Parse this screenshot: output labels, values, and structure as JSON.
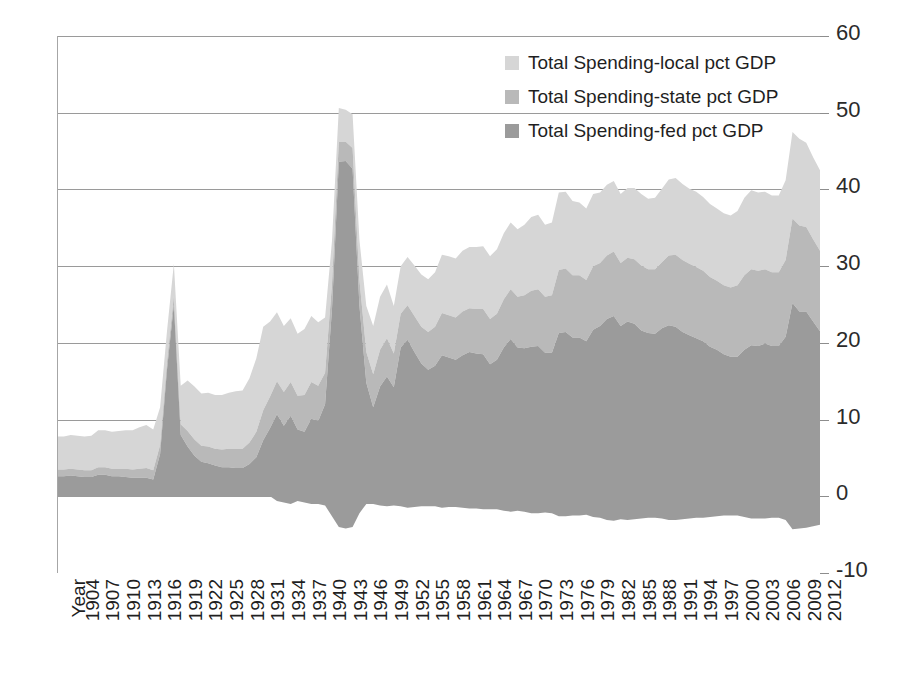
{
  "chart_data": {
    "type": "area",
    "stacked": true,
    "title": "",
    "xlabel": "Year",
    "ylabel": "",
    "ylim": [
      -10,
      60
    ],
    "yticks": [
      -10,
      0,
      10,
      20,
      30,
      40,
      50,
      60
    ],
    "ytick_labels": [
      "-10",
      "0",
      "10",
      "20",
      "30",
      "40",
      "50",
      "60"
    ],
    "grid": true,
    "legend_position": "top-right",
    "axis_label_first": "Year",
    "xtick_labels": [
      "1904",
      "1907",
      "1910",
      "1913",
      "1916",
      "1919",
      "1922",
      "1925",
      "1928",
      "1931",
      "1934",
      "1937",
      "1940",
      "1943",
      "1946",
      "1949",
      "1952",
      "1955",
      "1958",
      "1961",
      "1964",
      "1967",
      "1970",
      "1973",
      "1976",
      "1979",
      "1982",
      "1985",
      "1988",
      "1991",
      "1994",
      "1997",
      "2000",
      "2003",
      "2006",
      "2009",
      "2012"
    ],
    "xtick_step": 3,
    "x_start": 1902,
    "x_end": 2013,
    "colors": {
      "local": "#d6d6d6",
      "state": "#b9b9b9",
      "fed": "#9b9b9b",
      "gridline": "#9a9a9a",
      "axis": "#a6a6a6",
      "text": "#1f1f1f"
    },
    "x": [
      1902,
      1903,
      1904,
      1905,
      1906,
      1907,
      1908,
      1909,
      1910,
      1911,
      1912,
      1913,
      1914,
      1915,
      1916,
      1917,
      1918,
      1919,
      1920,
      1921,
      1922,
      1923,
      1924,
      1925,
      1926,
      1927,
      1928,
      1929,
      1930,
      1931,
      1932,
      1933,
      1934,
      1935,
      1936,
      1937,
      1938,
      1939,
      1940,
      1941,
      1942,
      1943,
      1944,
      1945,
      1946,
      1947,
      1948,
      1949,
      1950,
      1951,
      1952,
      1953,
      1954,
      1955,
      1956,
      1957,
      1958,
      1959,
      1960,
      1961,
      1962,
      1963,
      1964,
      1965,
      1966,
      1967,
      1968,
      1969,
      1970,
      1971,
      1972,
      1973,
      1974,
      1975,
      1976,
      1977,
      1978,
      1979,
      1980,
      1981,
      1982,
      1983,
      1984,
      1985,
      1986,
      1987,
      1988,
      1989,
      1990,
      1991,
      1992,
      1993,
      1994,
      1995,
      1996,
      1997,
      1998,
      1999,
      2000,
      2001,
      2002,
      2003,
      2004,
      2005,
      2006,
      2007,
      2008,
      2009,
      2010,
      2011,
      2012,
      2013
    ],
    "series": [
      {
        "name": "Total Spending-fed pct GDP",
        "key": "fed",
        "color": "#9b9b9b",
        "values": [
          2.6,
          2.6,
          2.7,
          2.6,
          2.5,
          2.5,
          2.8,
          2.8,
          2.6,
          2.6,
          2.5,
          2.4,
          2.4,
          2.4,
          2.2,
          5.5,
          16.5,
          25.0,
          8.0,
          6.5,
          5.3,
          4.5,
          4.3,
          4.0,
          3.8,
          3.8,
          3.7,
          3.7,
          4.2,
          5.1,
          7.3,
          8.9,
          10.7,
          9.2,
          10.5,
          8.7,
          8.4,
          10.1,
          9.8,
          12.0,
          24.3,
          43.6,
          43.7,
          42.7,
          24.8,
          14.8,
          11.6,
          14.3,
          15.6,
          14.2,
          19.4,
          20.4,
          18.8,
          17.3,
          16.5,
          17.0,
          18.4,
          18.1,
          17.8,
          18.4,
          18.8,
          18.6,
          18.5,
          17.2,
          17.8,
          19.4,
          20.5,
          19.4,
          19.3,
          19.5,
          19.6,
          18.7,
          18.7,
          21.3,
          21.4,
          20.7,
          20.7,
          20.2,
          21.7,
          22.2,
          23.1,
          23.5,
          22.2,
          22.8,
          22.5,
          21.6,
          21.3,
          21.2,
          21.9,
          22.3,
          22.1,
          21.4,
          21.0,
          20.6,
          20.2,
          19.5,
          19.1,
          18.5,
          18.2,
          18.2,
          19.1,
          19.7,
          19.6,
          19.9,
          19.6,
          19.6,
          20.8,
          25.2,
          24.1,
          24.1,
          22.8,
          21.5
        ]
      },
      {
        "name": "Total Spending-state pct GDP",
        "key": "state",
        "color": "#b9b9b9",
        "values": [
          0.9,
          0.9,
          0.9,
          0.9,
          0.9,
          0.9,
          1.0,
          1.0,
          1.0,
          1.0,
          1.1,
          1.1,
          1.2,
          1.3,
          1.2,
          1.2,
          1.0,
          1.1,
          1.4,
          2.0,
          2.1,
          2.1,
          2.2,
          2.2,
          2.3,
          2.4,
          2.5,
          2.5,
          2.8,
          3.3,
          3.9,
          4.1,
          4.3,
          4.4,
          4.4,
          4.4,
          4.8,
          4.8,
          4.6,
          4.1,
          3.3,
          2.6,
          2.5,
          2.7,
          3.4,
          4.0,
          4.3,
          4.8,
          5.0,
          4.4,
          4.4,
          4.5,
          4.7,
          4.8,
          4.9,
          5.1,
          5.5,
          5.5,
          5.5,
          5.7,
          5.7,
          5.8,
          5.9,
          5.9,
          6.0,
          6.3,
          6.5,
          6.6,
          6.9,
          7.3,
          7.4,
          7.3,
          7.5,
          8.2,
          8.3,
          8.1,
          8.1,
          8.0,
          8.3,
          8.2,
          8.3,
          8.4,
          8.2,
          8.3,
          8.4,
          8.5,
          8.3,
          8.4,
          8.6,
          9.1,
          9.4,
          9.4,
          9.3,
          9.3,
          9.2,
          9.1,
          9.0,
          9.0,
          9.0,
          9.3,
          9.7,
          9.9,
          9.8,
          9.7,
          9.6,
          9.6,
          10.0,
          11.0,
          11.2,
          11.0,
          10.7,
          10.5
        ]
      },
      {
        "name": "Total Spending-local pct GDP",
        "key": "local",
        "color": "#d6d6d6",
        "values": [
          4.3,
          4.3,
          4.4,
          4.4,
          4.4,
          4.5,
          4.8,
          4.8,
          4.8,
          4.9,
          5.0,
          5.1,
          5.4,
          5.6,
          5.3,
          4.9,
          4.0,
          4.2,
          5.0,
          6.6,
          6.9,
          6.8,
          7.0,
          7.0,
          7.1,
          7.3,
          7.5,
          7.6,
          8.4,
          9.6,
          10.9,
          9.8,
          9.0,
          8.6,
          8.3,
          8.1,
          8.6,
          8.6,
          8.3,
          7.2,
          5.6,
          4.4,
          4.2,
          4.4,
          5.2,
          6.0,
          6.3,
          6.9,
          7.0,
          6.2,
          6.2,
          6.3,
          6.6,
          6.8,
          6.9,
          7.1,
          7.6,
          7.7,
          7.7,
          7.9,
          8.0,
          8.1,
          8.2,
          8.2,
          8.4,
          8.6,
          8.7,
          8.8,
          9.2,
          9.6,
          9.7,
          9.4,
          9.5,
          10.1,
          10.0,
          9.7,
          9.5,
          9.3,
          9.4,
          9.2,
          9.2,
          9.2,
          9.0,
          9.1,
          9.3,
          9.3,
          9.2,
          9.3,
          9.6,
          9.9,
          10.0,
          9.9,
          9.8,
          9.8,
          9.6,
          9.5,
          9.4,
          9.4,
          9.4,
          9.7,
          10.1,
          10.3,
          10.2,
          10.1,
          10.0,
          10.0,
          10.4,
          11.3,
          11.3,
          11.0,
          10.7,
          10.5
        ]
      }
    ],
    "fed_deficit_floor": {
      "description": "federal band extends below zero baseline (deficit portion)",
      "values": [
        0,
        0,
        0,
        0,
        0,
        0,
        0,
        0,
        0,
        0,
        0,
        0,
        0,
        0,
        0,
        0,
        0,
        0,
        0,
        0,
        0,
        0,
        0,
        0,
        0,
        0,
        0,
        0,
        0,
        0,
        0,
        0,
        -0.6,
        -0.8,
        -1.0,
        -0.6,
        -0.8,
        -1.0,
        -1.0,
        -1.2,
        -2.6,
        -4.0,
        -4.2,
        -4.0,
        -2.2,
        -1.0,
        -1.0,
        -1.2,
        -1.3,
        -1.2,
        -1.3,
        -1.5,
        -1.4,
        -1.3,
        -1.3,
        -1.3,
        -1.5,
        -1.4,
        -1.4,
        -1.5,
        -1.6,
        -1.6,
        -1.7,
        -1.7,
        -1.7,
        -1.9,
        -2.0,
        -1.9,
        -2.0,
        -2.2,
        -2.2,
        -2.1,
        -2.2,
        -2.6,
        -2.6,
        -2.5,
        -2.5,
        -2.4,
        -2.7,
        -2.8,
        -3.1,
        -3.2,
        -3.0,
        -3.1,
        -3.0,
        -2.9,
        -2.8,
        -2.8,
        -2.9,
        -3.1,
        -3.1,
        -3.0,
        -2.9,
        -2.8,
        -2.8,
        -2.7,
        -2.6,
        -2.5,
        -2.5,
        -2.5,
        -2.7,
        -2.9,
        -2.9,
        -2.9,
        -2.8,
        -2.8,
        -3.1,
        -4.3,
        -4.2,
        -4.1,
        -3.9,
        -3.7
      ]
    }
  },
  "legend": {
    "items": [
      {
        "label": "Total Spending-local pct GDP",
        "color": "#d6d6d6"
      },
      {
        "label": "Total Spending-state pct GDP",
        "color": "#b9b9b9"
      },
      {
        "label": "Total Spending-fed pct GDP",
        "color": "#9b9b9b"
      }
    ]
  }
}
